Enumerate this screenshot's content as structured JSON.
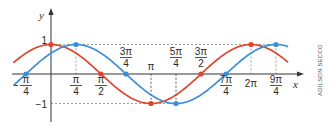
{
  "chart_data": {
    "type": "line",
    "title": "",
    "xlabel": "x",
    "ylabel": "y",
    "xlim": [
      -1.2,
      7.6
    ],
    "ylim": [
      -1.4,
      1.4
    ],
    "grid": false,
    "x_ticks": [
      {
        "value": -0.7854,
        "label": "-π/4",
        "num": "π",
        "den": "4",
        "neg": true,
        "pos": "below"
      },
      {
        "value": 0.7854,
        "label": "π/4",
        "num": "π",
        "den": "4",
        "pos": "below"
      },
      {
        "value": 1.5708,
        "label": "π/2",
        "num": "π",
        "den": "2",
        "pos": "below"
      },
      {
        "value": 2.3562,
        "label": "3π/4",
        "num": "3π",
        "den": "4",
        "pos": "above"
      },
      {
        "value": 3.1416,
        "label": "π",
        "num": "π",
        "den": "",
        "pos": "above"
      },
      {
        "value": 3.927,
        "label": "5π/4",
        "num": "5π",
        "den": "4",
        "pos": "above"
      },
      {
        "value": 4.7124,
        "label": "3π/2",
        "num": "3π",
        "den": "2",
        "pos": "above"
      },
      {
        "value": 5.4978,
        "label": "7π/4",
        "num": "7π",
        "den": "4",
        "pos": "below"
      },
      {
        "value": 6.2832,
        "label": "2π",
        "num": "2π",
        "den": "",
        "pos": "below"
      },
      {
        "value": 7.0686,
        "label": "9π/4",
        "num": "9π",
        "den": "4",
        "pos": "below"
      }
    ],
    "y_ticks": [
      {
        "value": 1,
        "label": "1"
      },
      {
        "value": -1,
        "label": "−1"
      }
    ],
    "series": [
      {
        "name": "f(x) = cos x",
        "color": "#e0452c",
        "function": "cos(x)",
        "marked_points": [
          [
            0,
            1
          ],
          [
            1.5708,
            0
          ],
          [
            3.1416,
            -1
          ],
          [
            4.7124,
            0
          ],
          [
            6.2832,
            1
          ]
        ]
      },
      {
        "name": "g(x) = sin(x + π/4)",
        "color": "#3a8fd6",
        "function": "sin(x + pi/4)",
        "marked_points": [
          [
            -0.7854,
            0
          ],
          [
            0.7854,
            1
          ],
          [
            2.3562,
            0
          ],
          [
            3.927,
            -1
          ],
          [
            5.4978,
            0
          ],
          [
            7.0686,
            1
          ]
        ]
      }
    ],
    "x_range_plotted": [
      -1.18,
      7.45
    ],
    "annotations": [
      "dashed guide lines at y = 1 and y = −1",
      "dashed vertical guides at extrema"
    ]
  },
  "credit": "ADILSON SECCO",
  "colors": {
    "axis": "#333333",
    "guide": "#777777",
    "red": "#e0452c",
    "blue": "#3a8fd6"
  }
}
